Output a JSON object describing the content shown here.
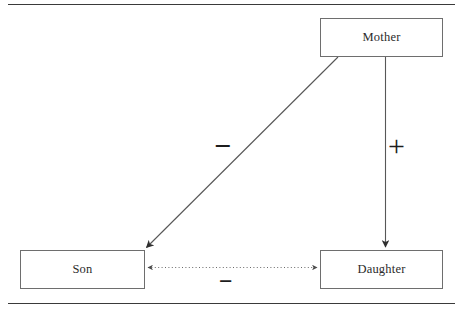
{
  "diagram": {
    "type": "signed-relationship-diagram",
    "background_color": "#ffffff",
    "rules": {
      "top_label": "top-horizontal-rule",
      "bottom_label": "bottom-horizontal-rule",
      "color": "#3a3a3a"
    },
    "nodes": [
      {
        "id": "mother",
        "label": "Mother",
        "x": 320,
        "y": 18,
        "width": 123,
        "height": 39
      },
      {
        "id": "son",
        "label": "Son",
        "x": 20,
        "y": 250,
        "width": 125,
        "height": 39
      },
      {
        "id": "daughter",
        "label": "Daughter",
        "x": 320,
        "y": 250,
        "width": 123,
        "height": 39
      }
    ],
    "node_border_color": "#6e6e6e",
    "edges": [
      {
        "id": "mother-to-son",
        "from": "mother",
        "to": "son",
        "sign": "−",
        "valence": "negative",
        "style": "solid",
        "arrow": "single",
        "color": "#555555"
      },
      {
        "id": "mother-to-daughter",
        "from": "mother",
        "to": "daughter",
        "sign": "+",
        "valence": "positive",
        "style": "solid",
        "arrow": "single",
        "color": "#555555"
      },
      {
        "id": "son-daughter",
        "from": "son",
        "to": "daughter",
        "sign": "−",
        "valence": "negative",
        "style": "dotted",
        "arrow": "double",
        "color": "#6a6a6a"
      }
    ]
  }
}
